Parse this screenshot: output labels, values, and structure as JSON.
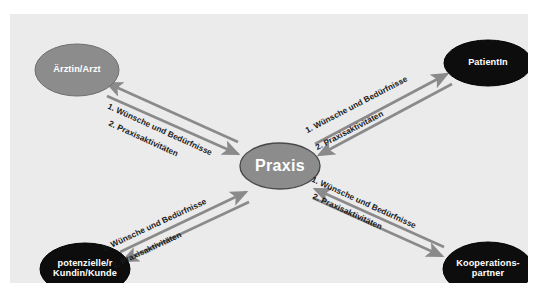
{
  "diagram": {
    "background_color": "#ebebeb",
    "page_color": "#ffffff",
    "arrow_color": "#8a8a8a",
    "nodes": [
      {
        "id": "arzt",
        "label": "Ärztin/Arzt",
        "label_line1": "Ärztin/Arzt",
        "label_line2": "",
        "fill": "#8c8c8c",
        "text_color": "#ffffff",
        "cx": 67,
        "cy": 56,
        "rx": 42,
        "ry": 26
      },
      {
        "id": "patientin",
        "label": "PatientIn",
        "label_line1": "PatientIn",
        "label_line2": "",
        "fill": "#0d0d0d",
        "text_color": "#ffffff",
        "cx": 478,
        "cy": 49,
        "rx": 44,
        "ry": 23
      },
      {
        "id": "praxis",
        "label": "Praxis",
        "label_line1": "Praxis",
        "label_line2": "",
        "fill": "#8c8c8c",
        "text_color": "#ffffff",
        "cx": 270,
        "cy": 152,
        "rx": 40,
        "ry": 23
      },
      {
        "id": "kunde",
        "label": "potenzielle/r Kundin/Kunde",
        "label_line1": "potenzielle/r",
        "label_line2": "Kundin/Kunde",
        "fill": "#0d0d0d",
        "text_color": "#ffffff",
        "cx": 75,
        "cy": 255,
        "rx": 45,
        "ry": 26
      },
      {
        "id": "kooperationspartner",
        "label": "Kooperations- partner",
        "label_line1": "Kooperations-",
        "label_line2": "partner",
        "fill": "#0d0d0d",
        "text_color": "#ffffff",
        "cx": 478,
        "cy": 255,
        "rx": 45,
        "ry": 27
      }
    ],
    "edges": [
      {
        "id": "praxis-arzt",
        "from": "praxis",
        "to": "arzt",
        "label_outbound": "1. Wünsche und Bedürfnisse",
        "label_inbound": "2. Praxisaktivitäten"
      },
      {
        "id": "praxis-patientin",
        "from": "praxis",
        "to": "patientin",
        "label_outbound": "1. Wünsche und Bedürfnisse",
        "label_inbound": "2. Praxisaktivitäten"
      },
      {
        "id": "praxis-kunde",
        "from": "praxis",
        "to": "kunde",
        "label_outbound": "1. Wünsche und Bedürfnisse",
        "label_inbound": "2. Praxisaktivitäten"
      },
      {
        "id": "praxis-kooperationspartner",
        "from": "praxis",
        "to": "kooperationspartner",
        "label_outbound": "1. Wünsche und Bedürfnisse",
        "label_inbound": "2. Praxisaktivitäten"
      }
    ]
  }
}
